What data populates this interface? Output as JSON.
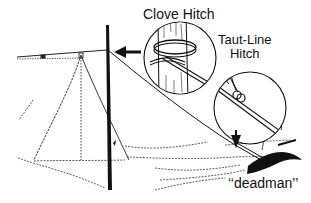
{
  "figure": {
    "labels": {
      "clove_hitch": "Clove Hitch",
      "taut_line_line1": "Taut-Line",
      "taut_line_line2": "Hitch",
      "deadman": "‘‘deadman’’"
    },
    "colors": {
      "ink": "#111111",
      "background": "#ffffff"
    }
  }
}
